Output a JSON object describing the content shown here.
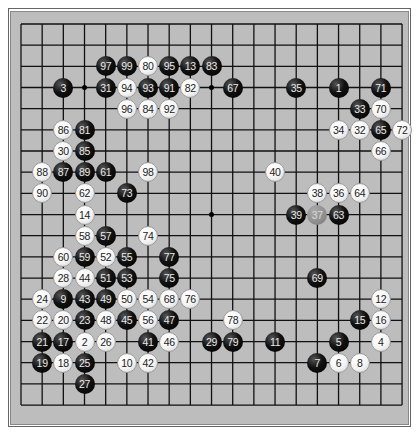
{
  "board": {
    "size": 19,
    "origin_x": 21,
    "origin_y": 24,
    "spacing": 21.17,
    "colors": {
      "background": "#bdbdbd",
      "line": "#111111",
      "black_stone": "#000000",
      "white_stone": "#ffffff",
      "marked_stone": "#8d8d8d"
    },
    "hoshi": [
      [
        3,
        3
      ],
      [
        9,
        3
      ],
      [
        15,
        3
      ],
      [
        3,
        9
      ],
      [
        9,
        9
      ],
      [
        15,
        9
      ],
      [
        3,
        15
      ],
      [
        9,
        15
      ],
      [
        15,
        15
      ]
    ],
    "stones": [
      {
        "n": "97",
        "c": 4,
        "r": 2,
        "color": "B"
      },
      {
        "n": "99",
        "c": 5,
        "r": 2,
        "color": "B"
      },
      {
        "n": "80",
        "c": 6,
        "r": 2,
        "color": "W"
      },
      {
        "n": "95",
        "c": 7,
        "r": 2,
        "color": "B"
      },
      {
        "n": "13",
        "c": 8,
        "r": 2,
        "color": "B"
      },
      {
        "n": "83",
        "c": 9,
        "r": 2,
        "color": "B"
      },
      {
        "n": "3",
        "c": 2,
        "r": 3,
        "color": "B"
      },
      {
        "n": "31",
        "c": 4,
        "r": 3,
        "color": "B"
      },
      {
        "n": "94",
        "c": 5,
        "r": 3,
        "color": "W"
      },
      {
        "n": "93",
        "c": 6,
        "r": 3,
        "color": "B"
      },
      {
        "n": "91",
        "c": 7,
        "r": 3,
        "color": "B"
      },
      {
        "n": "82",
        "c": 8,
        "r": 3,
        "color": "W"
      },
      {
        "n": "67",
        "c": 10,
        "r": 3,
        "color": "B"
      },
      {
        "n": "35",
        "c": 13,
        "r": 3,
        "color": "B"
      },
      {
        "n": "1",
        "c": 15,
        "r": 3,
        "color": "B"
      },
      {
        "n": "71",
        "c": 17,
        "r": 3,
        "color": "B"
      },
      {
        "n": "96",
        "c": 5,
        "r": 4,
        "color": "W"
      },
      {
        "n": "84",
        "c": 6,
        "r": 4,
        "color": "W"
      },
      {
        "n": "92",
        "c": 7,
        "r": 4,
        "color": "W"
      },
      {
        "n": "33",
        "c": 16,
        "r": 4,
        "color": "B"
      },
      {
        "n": "70",
        "c": 17,
        "r": 4,
        "color": "W"
      },
      {
        "n": "86",
        "c": 2,
        "r": 5,
        "color": "W"
      },
      {
        "n": "81",
        "c": 3,
        "r": 5,
        "color": "B"
      },
      {
        "n": "34",
        "c": 15,
        "r": 5,
        "color": "W"
      },
      {
        "n": "32",
        "c": 16,
        "r": 5,
        "color": "W"
      },
      {
        "n": "65",
        "c": 17,
        "r": 5,
        "color": "B"
      },
      {
        "n": "72",
        "c": 18,
        "r": 5,
        "color": "W"
      },
      {
        "n": "30",
        "c": 2,
        "r": 6,
        "color": "W"
      },
      {
        "n": "85",
        "c": 3,
        "r": 6,
        "color": "B"
      },
      {
        "n": "66",
        "c": 17,
        "r": 6,
        "color": "W"
      },
      {
        "n": "88",
        "c": 1,
        "r": 7,
        "color": "W"
      },
      {
        "n": "87",
        "c": 2,
        "r": 7,
        "color": "B"
      },
      {
        "n": "89",
        "c": 3,
        "r": 7,
        "color": "B"
      },
      {
        "n": "61",
        "c": 4,
        "r": 7,
        "color": "B"
      },
      {
        "n": "98",
        "c": 6,
        "r": 7,
        "color": "W"
      },
      {
        "n": "40",
        "c": 12,
        "r": 7,
        "color": "W"
      },
      {
        "n": "90",
        "c": 1,
        "r": 8,
        "color": "W"
      },
      {
        "n": "62",
        "c": 3,
        "r": 8,
        "color": "W"
      },
      {
        "n": "73",
        "c": 5,
        "r": 8,
        "color": "B"
      },
      {
        "n": "38",
        "c": 14,
        "r": 8,
        "color": "W"
      },
      {
        "n": "36",
        "c": 15,
        "r": 8,
        "color": "W"
      },
      {
        "n": "64",
        "c": 16,
        "r": 8,
        "color": "W"
      },
      {
        "n": "14",
        "c": 3,
        "r": 9,
        "color": "W"
      },
      {
        "n": "39",
        "c": 13,
        "r": 9,
        "color": "B"
      },
      {
        "n": "37",
        "c": 14,
        "r": 9,
        "color": "G"
      },
      {
        "n": "63",
        "c": 15,
        "r": 9,
        "color": "B"
      },
      {
        "n": "58",
        "c": 3,
        "r": 10,
        "color": "W"
      },
      {
        "n": "57",
        "c": 4,
        "r": 10,
        "color": "B"
      },
      {
        "n": "74",
        "c": 6,
        "r": 10,
        "color": "W"
      },
      {
        "n": "60",
        "c": 2,
        "r": 11,
        "color": "W"
      },
      {
        "n": "59",
        "c": 3,
        "r": 11,
        "color": "B"
      },
      {
        "n": "52",
        "c": 4,
        "r": 11,
        "color": "W"
      },
      {
        "n": "55",
        "c": 5,
        "r": 11,
        "color": "B"
      },
      {
        "n": "77",
        "c": 7,
        "r": 11,
        "color": "B"
      },
      {
        "n": "28",
        "c": 2,
        "r": 12,
        "color": "W"
      },
      {
        "n": "44",
        "c": 3,
        "r": 12,
        "color": "W"
      },
      {
        "n": "51",
        "c": 4,
        "r": 12,
        "color": "B"
      },
      {
        "n": "53",
        "c": 5,
        "r": 12,
        "color": "B"
      },
      {
        "n": "75",
        "c": 7,
        "r": 12,
        "color": "B"
      },
      {
        "n": "69",
        "c": 14,
        "r": 12,
        "color": "B"
      },
      {
        "n": "24",
        "c": 1,
        "r": 13,
        "color": "W"
      },
      {
        "n": "9",
        "c": 2,
        "r": 13,
        "color": "B"
      },
      {
        "n": "43",
        "c": 3,
        "r": 13,
        "color": "B"
      },
      {
        "n": "49",
        "c": 4,
        "r": 13,
        "color": "B"
      },
      {
        "n": "50",
        "c": 5,
        "r": 13,
        "color": "W"
      },
      {
        "n": "54",
        "c": 6,
        "r": 13,
        "color": "W"
      },
      {
        "n": "68",
        "c": 7,
        "r": 13,
        "color": "W"
      },
      {
        "n": "76",
        "c": 8,
        "r": 13,
        "color": "W"
      },
      {
        "n": "12",
        "c": 17,
        "r": 13,
        "color": "W"
      },
      {
        "n": "22",
        "c": 1,
        "r": 14,
        "color": "W"
      },
      {
        "n": "20",
        "c": 2,
        "r": 14,
        "color": "W"
      },
      {
        "n": "23",
        "c": 3,
        "r": 14,
        "color": "B"
      },
      {
        "n": "48",
        "c": 4,
        "r": 14,
        "color": "W"
      },
      {
        "n": "45",
        "c": 5,
        "r": 14,
        "color": "B"
      },
      {
        "n": "56",
        "c": 6,
        "r": 14,
        "color": "W"
      },
      {
        "n": "47",
        "c": 7,
        "r": 14,
        "color": "B"
      },
      {
        "n": "78",
        "c": 10,
        "r": 14,
        "color": "W"
      },
      {
        "n": "15",
        "c": 16,
        "r": 14,
        "color": "B"
      },
      {
        "n": "16",
        "c": 17,
        "r": 14,
        "color": "W"
      },
      {
        "n": "21",
        "c": 1,
        "r": 15,
        "color": "B"
      },
      {
        "n": "17",
        "c": 2,
        "r": 15,
        "color": "B"
      },
      {
        "n": "2",
        "c": 3,
        "r": 15,
        "color": "W"
      },
      {
        "n": "26",
        "c": 4,
        "r": 15,
        "color": "W"
      },
      {
        "n": "41",
        "c": 6,
        "r": 15,
        "color": "B"
      },
      {
        "n": "46",
        "c": 7,
        "r": 15,
        "color": "W"
      },
      {
        "n": "29",
        "c": 9,
        "r": 15,
        "color": "B"
      },
      {
        "n": "79",
        "c": 10,
        "r": 15,
        "color": "B"
      },
      {
        "n": "11",
        "c": 12,
        "r": 15,
        "color": "B"
      },
      {
        "n": "5",
        "c": 15,
        "r": 15,
        "color": "B"
      },
      {
        "n": "4",
        "c": 17,
        "r": 15,
        "color": "W"
      },
      {
        "n": "19",
        "c": 1,
        "r": 16,
        "color": "B"
      },
      {
        "n": "18",
        "c": 2,
        "r": 16,
        "color": "W"
      },
      {
        "n": "25",
        "c": 3,
        "r": 16,
        "color": "B"
      },
      {
        "n": "10",
        "c": 5,
        "r": 16,
        "color": "W"
      },
      {
        "n": "42",
        "c": 6,
        "r": 16,
        "color": "W"
      },
      {
        "n": "7",
        "c": 14,
        "r": 16,
        "color": "B"
      },
      {
        "n": "6",
        "c": 15,
        "r": 16,
        "color": "W"
      },
      {
        "n": "8",
        "c": 16,
        "r": 16,
        "color": "W"
      },
      {
        "n": "27",
        "c": 3,
        "r": 17,
        "color": "B"
      }
    ]
  }
}
